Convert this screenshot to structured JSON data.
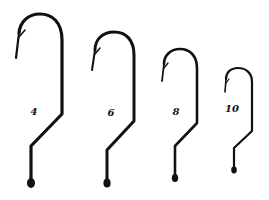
{
  "figure": {
    "background": "#ffffff",
    "stroke_color": "#111111"
  },
  "hooks": [
    {
      "size_label": "4",
      "label_x": 34,
      "label_y": 111
    },
    {
      "size_label": "6",
      "label_x": 111,
      "label_y": 112
    },
    {
      "size_label": "8",
      "label_x": 176,
      "label_y": 111
    },
    {
      "size_label": "10",
      "label_x": 232,
      "label_y": 108
    }
  ]
}
